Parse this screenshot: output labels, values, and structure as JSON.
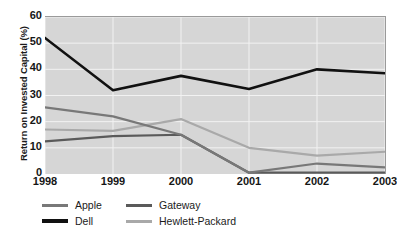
{
  "chart_data": {
    "type": "line",
    "title": "",
    "xlabel": "",
    "ylabel": "Return on Invested Capital (%)",
    "categories": [
      "1998",
      "1999",
      "2000",
      "2001",
      "2002",
      "2003"
    ],
    "x": [
      1998,
      1999,
      2000,
      2001,
      2002,
      2003
    ],
    "ylim": [
      0,
      60
    ],
    "yticks": [
      0,
      10,
      20,
      30,
      40,
      50,
      60
    ],
    "grid": true,
    "legend_position": "bottom-left",
    "series": [
      {
        "name": "Apple",
        "color": "#787878",
        "values": [
          25.5,
          22.0,
          15.0,
          0.5,
          4.0,
          2.5
        ]
      },
      {
        "name": "Dell",
        "color": "#111111",
        "values": [
          52.0,
          32.0,
          37.5,
          32.5,
          40.0,
          38.5
        ]
      },
      {
        "name": "Gateway",
        "color": "#5a5a5a",
        "values": [
          12.5,
          14.5,
          15.0,
          0.5,
          0.5,
          0.5
        ]
      },
      {
        "name": "Hewlett-Packard",
        "color": "#a9a9a9",
        "values": [
          17.0,
          16.5,
          21.0,
          10.0,
          7.0,
          8.5
        ]
      }
    ]
  },
  "axis": {
    "y_title": "Return on Invested Capital (%)",
    "y_ticks": [
      "60",
      "50",
      "40",
      "30",
      "20",
      "10",
      "0"
    ],
    "x_ticks": [
      "1998",
      "1999",
      "2000",
      "2001",
      "2002",
      "2003"
    ]
  },
  "legend": {
    "items": [
      {
        "label": "Apple",
        "color": "#787878"
      },
      {
        "label": "Gateway",
        "color": "#5a5a5a"
      },
      {
        "label": "Dell",
        "color": "#111111"
      },
      {
        "label": "Hewlett-Packard",
        "color": "#a9a9a9"
      }
    ]
  },
  "style": {
    "plot_background": "#d6d6d6",
    "gridline_color": "#f2f2f2",
    "axis_color": "#9a9a9a",
    "text_color": "#161616",
    "page_background": "#ffffff"
  }
}
